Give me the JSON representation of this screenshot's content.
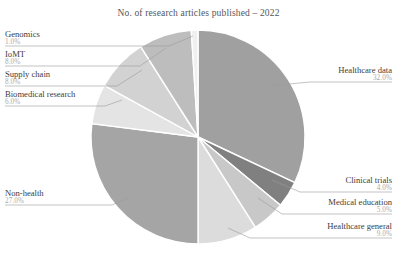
{
  "chart_data": {
    "type": "pie",
    "title": "No. of research articles published – 2022",
    "xlabel": "",
    "ylabel": "",
    "legend_position": "none",
    "grid": false,
    "labels": [
      "Healthcare data",
      "Clinical trials",
      "Medical education",
      "Healthcare general",
      "Non-health",
      "Biomedical research",
      "Supply chain",
      "IoMT",
      "Genomics"
    ],
    "values": [
      32.0,
      4.0,
      5.0,
      9.0,
      27.0,
      6.0,
      8.0,
      8.0,
      1.0
    ],
    "value_labels": [
      "32.0%",
      "4.0%",
      "5.0%",
      "9.0%",
      "27.0%",
      "6.0%",
      "8.0%",
      "8.0%",
      "1.0%"
    ],
    "colors": [
      "#a0a0a0",
      "#808080",
      "#c8c8c8",
      "#dcdcdc",
      "#a5a5a5",
      "#e4e4e4",
      "#d2d2d2",
      "#bdbdbd",
      "#f0f0f0"
    ],
    "slices": [
      {
        "label": "Healthcare data",
        "value": 32.0,
        "value_label": "32.0%",
        "color": "#a0a0a0"
      },
      {
        "label": "Clinical trials",
        "value": 4.0,
        "value_label": "4.0%",
        "color": "#808080"
      },
      {
        "label": "Medical education",
        "value": 5.0,
        "value_label": "5.0%",
        "color": "#c8c8c8"
      },
      {
        "label": "Healthcare general",
        "value": 9.0,
        "value_label": "9.0%",
        "color": "#dcdcdc"
      },
      {
        "label": "Non-health",
        "value": 27.0,
        "value_label": "27.0%",
        "color": "#a5a5a5"
      },
      {
        "label": "Biomedical research",
        "value": 6.0,
        "value_label": "6.0%",
        "color": "#e4e4e4"
      },
      {
        "label": "Supply chain",
        "value": 8.0,
        "value_label": "8.0%",
        "color": "#d2d2d2"
      },
      {
        "label": "IoMT",
        "value": 8.0,
        "value_label": "8.0%",
        "color": "#bdbdbd"
      },
      {
        "label": "Genomics",
        "value": 1.0,
        "value_label": "1.0%",
        "color": "#f0f0f0"
      }
    ],
    "start_angle_deg": 0,
    "direction": "clockwise",
    "total": 100.0
  },
  "callouts": {
    "genomics": {
      "label": "Genomics",
      "pct": "1.0%"
    },
    "iomt": {
      "label": "IoMT",
      "pct": "8.0%"
    },
    "supply_chain": {
      "label": "Supply chain",
      "pct": "8.0%"
    },
    "biomedical": {
      "label": "Biomedical research",
      "pct": "6.0%"
    },
    "non_health": {
      "label": "Non-health",
      "pct": "27.0%"
    },
    "healthcare_data": {
      "label": "Healthcare data",
      "pct": "32.0%"
    },
    "clinical_trials": {
      "label": "Clinical trials",
      "pct": "4.0%"
    },
    "medical_education": {
      "label": "Medical education",
      "pct": "5.0%"
    },
    "healthcare_general": {
      "label": "Healthcare general",
      "pct": "9.0%"
    }
  }
}
